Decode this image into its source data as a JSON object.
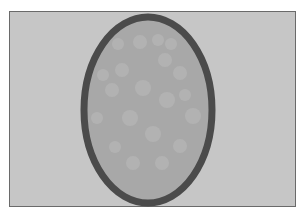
{
  "scene": {
    "description": "Grayscale illustration of a vertical oval with a thick dark outline and faint lighter circular spots, on a light gray rectangular field",
    "colors": {
      "page": "#ffffff",
      "field": "#c6c6c6",
      "frame_border": "#6a6a6a",
      "oval_fill": "#a8a8a8",
      "oval_border": "#4b4b4b",
      "spot": "#b6b6b6"
    },
    "oval": {
      "cx": 148,
      "cy": 110,
      "rx": 64,
      "ry": 93,
      "stroke_width": 7
    },
    "spots": [
      {
        "cx": 140,
        "cy": 42,
        "r": 7
      },
      {
        "cx": 158,
        "cy": 40,
        "r": 6
      },
      {
        "cx": 171,
        "cy": 44,
        "r": 6
      },
      {
        "cx": 118,
        "cy": 44,
        "r": 6
      },
      {
        "cx": 122,
        "cy": 70,
        "r": 7
      },
      {
        "cx": 165,
        "cy": 60,
        "r": 7
      },
      {
        "cx": 180,
        "cy": 73,
        "r": 7
      },
      {
        "cx": 143,
        "cy": 88,
        "r": 8
      },
      {
        "cx": 112,
        "cy": 90,
        "r": 7
      },
      {
        "cx": 167,
        "cy": 100,
        "r": 8
      },
      {
        "cx": 130,
        "cy": 118,
        "r": 8
      },
      {
        "cx": 97,
        "cy": 118,
        "r": 6
      },
      {
        "cx": 193,
        "cy": 116,
        "r": 8
      },
      {
        "cx": 153,
        "cy": 134,
        "r": 8
      },
      {
        "cx": 115,
        "cy": 147,
        "r": 6
      },
      {
        "cx": 180,
        "cy": 146,
        "r": 7
      },
      {
        "cx": 133,
        "cy": 163,
        "r": 7
      },
      {
        "cx": 162,
        "cy": 163,
        "r": 7
      },
      {
        "cx": 103,
        "cy": 75,
        "r": 6
      },
      {
        "cx": 185,
        "cy": 95,
        "r": 6
      }
    ]
  }
}
